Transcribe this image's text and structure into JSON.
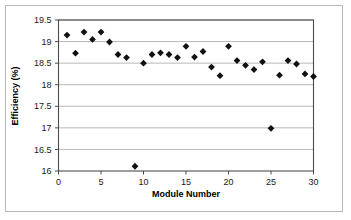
{
  "figure": {
    "background_color": "#ffffff",
    "border_color": "#b9b9b9",
    "axis_color": "#4d4d4d",
    "grid_color": "#a6a6a6",
    "marker_color": "#111111"
  },
  "chart_data": {
    "type": "scatter",
    "title": "",
    "xlabel": "Module  Number",
    "ylabel": "Efficiency (%)",
    "xlim": [
      0,
      30
    ],
    "ylim": [
      16,
      19.5
    ],
    "xticks": [
      0,
      5,
      10,
      15,
      20,
      25,
      30
    ],
    "xtick_labels": [
      "0",
      "5",
      "10",
      "15",
      "20",
      "25",
      "30"
    ],
    "yticks": [
      16,
      16.5,
      17,
      17.5,
      18,
      18.5,
      19,
      19.5
    ],
    "ytick_labels": [
      "16",
      "16.5",
      "17",
      "17.5",
      "18",
      "18.5",
      "19",
      "19.5"
    ],
    "grid": "horizontal",
    "legend": "none",
    "marker_shape": "diamond",
    "series": [
      {
        "name": "Module efficiency",
        "x": [
          1,
          2,
          3,
          4,
          5,
          6,
          7,
          8,
          9,
          10,
          11,
          12,
          13,
          14,
          15,
          16,
          17,
          18,
          19,
          20,
          21,
          22,
          23,
          24,
          25,
          26,
          27,
          28,
          29,
          30
        ],
        "values": [
          19.15,
          18.73,
          19.22,
          19.05,
          19.22,
          18.99,
          18.7,
          18.63,
          16.11,
          18.5,
          18.7,
          18.74,
          18.7,
          18.63,
          18.89,
          18.64,
          18.77,
          18.41,
          18.21,
          18.89,
          18.56,
          18.45,
          18.35,
          18.53,
          16.99,
          18.22,
          18.56,
          18.48,
          18.25,
          18.19
        ]
      }
    ]
  }
}
